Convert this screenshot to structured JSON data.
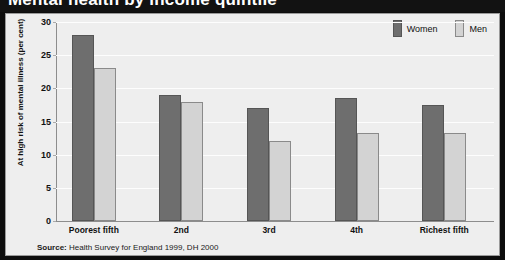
{
  "title": "Mental health by income quintile",
  "legend": {
    "women_label": "Women",
    "men_label": "Men",
    "women_color": "#6e6e6e",
    "men_color": "#d3d3d3"
  },
  "source": {
    "prefix": "Source:",
    "text": " Health Survey for England 1999, DH 2000"
  },
  "chart_data": {
    "type": "bar",
    "title": "",
    "xlabel": "Income quintiles",
    "ylabel": "At high risk of mental illness (per cent)",
    "categories": [
      "Poorest fifth",
      "2nd",
      "3rd",
      "4th",
      "Richest fifth"
    ],
    "series": [
      {
        "name": "Women",
        "color": "#6e6e6e",
        "values": [
          28,
          19,
          17,
          18.5,
          17.5
        ]
      },
      {
        "name": "Men",
        "color": "#d3d3d3",
        "values": [
          23,
          18,
          12,
          13.3,
          13.3
        ]
      }
    ],
    "ylim": [
      0,
      30
    ],
    "yticks": [
      0,
      5,
      10,
      15,
      20,
      25,
      30
    ],
    "grid": true,
    "legend_position": "top-right"
  }
}
